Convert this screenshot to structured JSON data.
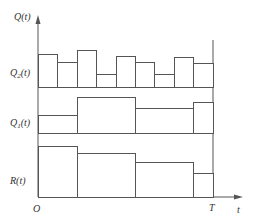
{
  "diagram": {
    "y_axis_label": "Q(t)",
    "x_axis_label": "t",
    "origin_label": "O",
    "end_label": "T",
    "colors": {
      "line": "#555555",
      "text": "#333333",
      "background": "#ffffff"
    },
    "bands": [
      {
        "name": "Q2",
        "label_main": "Q",
        "label_sub": "2",
        "label_tail": "(t)",
        "base_y": 87,
        "bars": [
          {
            "x0": 38,
            "x1": 57,
            "top": 54
          },
          {
            "x0": 57,
            "x1": 77,
            "top": 62
          },
          {
            "x0": 77,
            "x1": 96,
            "top": 50
          },
          {
            "x0": 96,
            "x1": 116,
            "top": 74
          },
          {
            "x0": 116,
            "x1": 135,
            "top": 56
          },
          {
            "x0": 135,
            "x1": 154,
            "top": 62
          },
          {
            "x0": 154,
            "x1": 174,
            "top": 74
          },
          {
            "x0": 174,
            "x1": 193,
            "top": 57
          },
          {
            "x0": 193,
            "x1": 213,
            "top": 63
          }
        ]
      },
      {
        "name": "Q1",
        "label_main": "Q",
        "label_sub": "1",
        "label_tail": "(t)",
        "base_y": 133,
        "bars": [
          {
            "x0": 38,
            "x1": 77,
            "top": 115
          },
          {
            "x0": 77,
            "x1": 135,
            "top": 97
          },
          {
            "x0": 135,
            "x1": 193,
            "top": 108
          },
          {
            "x0": 193,
            "x1": 213,
            "top": 102
          }
        ]
      },
      {
        "name": "R",
        "label_main": "R",
        "label_sub": "",
        "label_tail": "(t)",
        "base_y": 197,
        "bars": [
          {
            "x0": 38,
            "x1": 77,
            "top": 146
          },
          {
            "x0": 77,
            "x1": 135,
            "top": 153
          },
          {
            "x0": 135,
            "x1": 193,
            "top": 162
          },
          {
            "x0": 193,
            "x1": 213,
            "top": 173
          }
        ]
      }
    ]
  }
}
